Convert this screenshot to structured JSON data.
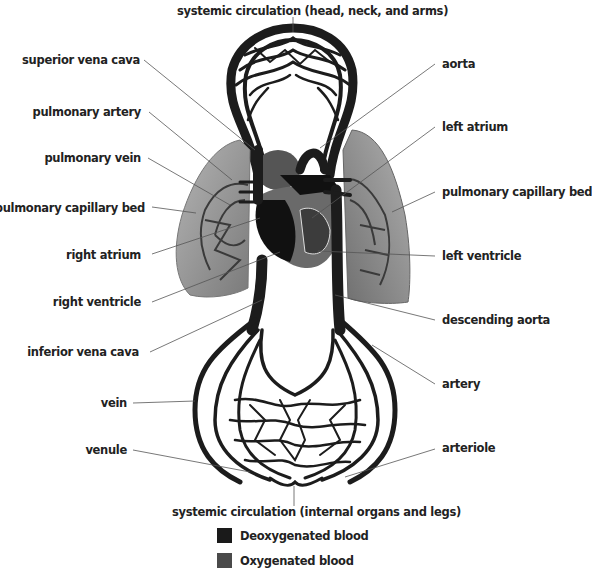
{
  "labels": {
    "systemic_upper": "systemic circulation (head, neck, and arms)",
    "superior_vena_cava": "superior vena cava",
    "pulmonary_artery": "pulmonary artery",
    "pulmonary_vein": "pulmonary vein",
    "pulmonary_capillary_bed_left": "pulmonary capillary bed",
    "right_atrium": "right atrium",
    "right_ventricle": "right ventricle",
    "inferior_vena_cava": "inferior vena cava",
    "vein": "vein",
    "venule": "venule",
    "aorta": "aorta",
    "left_atrium": "left atrium",
    "pulmonary_capillary_bed_right": "pulmonary capillary bed",
    "left_ventricle": "left ventricle",
    "descending_aorta": "descending aorta",
    "artery": "artery",
    "arteriole": "arteriole",
    "systemic_lower": "systemic circulation (internal organs and legs)"
  },
  "legend": [
    {
      "label": "Deoxygenated blood",
      "color": "#1a1a1a"
    },
    {
      "label": "Oxygenated blood",
      "color": "#4a4a4a"
    }
  ],
  "colors": {
    "vessel": "#1c1c1c",
    "lung": "#8a8a8a",
    "lung_light": "#a8a8a8",
    "heart_oxygenated": "#5a5a5a",
    "leader_line": "#555555"
  }
}
